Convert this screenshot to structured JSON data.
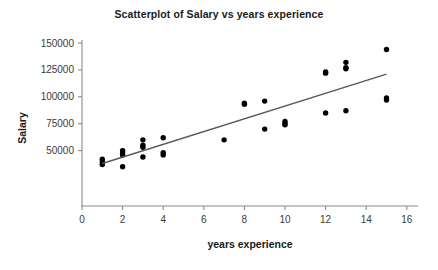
{
  "chart_data": {
    "type": "scatter",
    "title": "Scatterplot of Salary vs years experience",
    "xlabel": "years experience",
    "ylabel": "Salary",
    "xlim": [
      0,
      16.6
    ],
    "ylim": [
      25000,
      152000
    ],
    "xticks": [
      0,
      2,
      4,
      6,
      8,
      10,
      12,
      14,
      16
    ],
    "xtick_labels": [
      "0",
      "2",
      "4",
      "6",
      "8",
      "10",
      "12",
      "14",
      "16"
    ],
    "yticks": [
      50000,
      75000,
      100000,
      125000,
      150000
    ],
    "ytick_labels": [
      "50000",
      "75000",
      "100000",
      "125000",
      "150000"
    ],
    "grid": false,
    "legend": false,
    "point_color": "#000000",
    "line_color": "#595959",
    "axis_color": "#8a8a8a",
    "points": [
      {
        "x": 1,
        "y": 42000
      },
      {
        "x": 1,
        "y": 39500
      },
      {
        "x": 1,
        "y": 37000
      },
      {
        "x": 2,
        "y": 50000
      },
      {
        "x": 2,
        "y": 48000
      },
      {
        "x": 2,
        "y": 46000
      },
      {
        "x": 2,
        "y": 35000
      },
      {
        "x": 3,
        "y": 60000
      },
      {
        "x": 3,
        "y": 55000
      },
      {
        "x": 3,
        "y": 53000
      },
      {
        "x": 3,
        "y": 44000
      },
      {
        "x": 4,
        "y": 62000
      },
      {
        "x": 4,
        "y": 48000
      },
      {
        "x": 4,
        "y": 46000
      },
      {
        "x": 7,
        "y": 60000
      },
      {
        "x": 8,
        "y": 94000
      },
      {
        "x": 8,
        "y": 93000
      },
      {
        "x": 9,
        "y": 96000
      },
      {
        "x": 9,
        "y": 70000
      },
      {
        "x": 10,
        "y": 77000
      },
      {
        "x": 10,
        "y": 75000
      },
      {
        "x": 10,
        "y": 74000
      },
      {
        "x": 12,
        "y": 123000
      },
      {
        "x": 12,
        "y": 122000
      },
      {
        "x": 12,
        "y": 85000
      },
      {
        "x": 13,
        "y": 132000
      },
      {
        "x": 13,
        "y": 127000
      },
      {
        "x": 13,
        "y": 126000
      },
      {
        "x": 13,
        "y": 87000
      },
      {
        "x": 15,
        "y": 144000
      },
      {
        "x": 15,
        "y": 99000
      },
      {
        "x": 15,
        "y": 97000
      }
    ],
    "fit_line": {
      "x0": 1.0,
      "y0": 38000,
      "x1": 15.0,
      "y1": 121000
    }
  }
}
